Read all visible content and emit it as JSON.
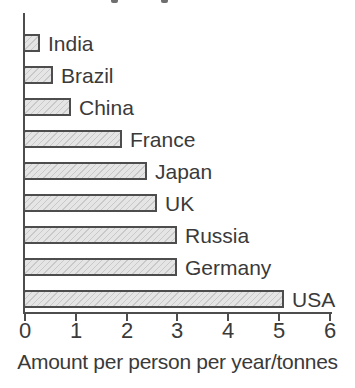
{
  "chart_data": {
    "type": "bar",
    "orientation": "horizontal",
    "categories": [
      "India",
      "Brazil",
      "China",
      "France",
      "Japan",
      "UK",
      "Russia",
      "Germany",
      "USA"
    ],
    "values": [
      0.3,
      0.55,
      0.9,
      1.9,
      2.4,
      2.6,
      3.0,
      3.0,
      5.1
    ],
    "xlabel": "Amount per person per year/tonnes",
    "x_ticks": [
      "0",
      "1",
      "2",
      "3",
      "4",
      "5",
      "6"
    ],
    "xlim": [
      0,
      6
    ],
    "grid": false,
    "legend": false,
    "styles": {
      "bar_fill": "#e5e5e5",
      "bar_hatch_line": "#c9c9c9",
      "bar_border": "#4d4d4d",
      "axis_color": "#4d4d4d",
      "text_color": "#3a3a3a",
      "background": "#ffffff"
    }
  }
}
